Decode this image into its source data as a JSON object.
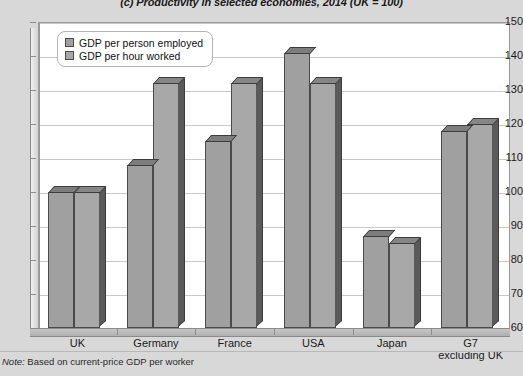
{
  "title": "(c) Productivity in selected economies, 2014 (UK = 100)",
  "note_prefix": "Note:",
  "note_text": "Based on current-price GDP per worker",
  "legend": [
    {
      "label": "GDP per person employed",
      "swatch": "legend-swatch-person-employed"
    },
    {
      "label": "GDP per hour worked",
      "swatch": "legend-swatch-hour-worked"
    }
  ],
  "chart_data": {
    "type": "bar",
    "title": "(c) Productivity in selected economies, 2014 (UK = 100)",
    "xlabel": "",
    "ylabel": "",
    "ylim": [
      60,
      150
    ],
    "yticks": [
      60,
      70,
      80,
      90,
      100,
      110,
      120,
      130,
      140,
      150
    ],
    "ytick_labels": [
      "60",
      "70",
      "80",
      "90",
      "100",
      "110",
      "120",
      "130",
      "140",
      "150"
    ],
    "grid": true,
    "legend_position": "upper-left",
    "categories": [
      "UK",
      "Germany",
      "France",
      "USA",
      "Japan",
      "G7\nexcluding UK"
    ],
    "category_labels": [
      {
        "line1": "UK",
        "line2": ""
      },
      {
        "line1": "Germany",
        "line2": ""
      },
      {
        "line1": "France",
        "line2": ""
      },
      {
        "line1": "USA",
        "line2": ""
      },
      {
        "line1": "Japan",
        "line2": ""
      },
      {
        "line1": "G7",
        "line2": "excluding UK"
      }
    ],
    "series": [
      {
        "name": "GDP per person employed",
        "color": "#a0a0a0",
        "values": [
          100,
          108,
          115,
          141,
          87,
          118
        ]
      },
      {
        "name": "GDP per hour worked",
        "color": "#a8a8a8",
        "values": [
          100,
          132,
          132,
          132,
          85,
          120
        ]
      }
    ]
  }
}
